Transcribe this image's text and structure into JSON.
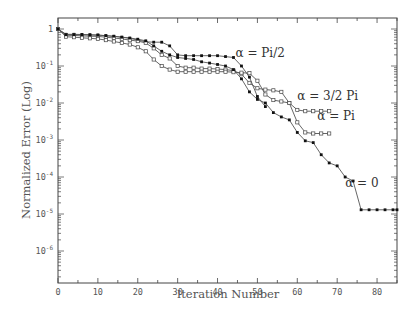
{
  "chart_data": {
    "type": "line",
    "title": "",
    "xlabel": "Iteration Number",
    "ylabel": "Normalized Error (Log)",
    "xlim": [
      0,
      85
    ],
    "ylim": [
      1e-07,
      1.6
    ],
    "yscale": "log",
    "grid": false,
    "legend": "inline labels",
    "x_ticks": [
      0,
      10,
      20,
      30,
      40,
      50,
      60,
      70,
      80
    ],
    "x_tick_labels": [
      "0",
      "10",
      "20",
      "30",
      "40",
      "50",
      "60",
      "70",
      "80"
    ],
    "y_ticks": [
      1,
      0.1,
      0.01,
      0.001,
      0.0001,
      1e-05,
      1e-06
    ],
    "y_tick_labels": [
      "1",
      "10⁻¹",
      "10⁻²",
      "10⁻³",
      "10⁻⁴",
      "10⁻⁵",
      "10⁻⁶"
    ],
    "series": [
      {
        "name": "α = Pi/2",
        "label": "α = Pi/2",
        "marker": "circle-filled",
        "x": [
          0,
          2,
          4,
          6,
          8,
          10,
          12,
          14,
          16,
          18,
          20,
          22,
          24,
          26,
          28,
          30,
          32,
          34,
          36,
          38,
          40,
          42,
          44,
          46,
          48,
          50,
          52
        ],
        "y": [
          1.0,
          0.72,
          0.72,
          0.71,
          0.7,
          0.69,
          0.66,
          0.63,
          0.6,
          0.56,
          0.5,
          0.45,
          0.44,
          0.44,
          0.35,
          0.2,
          0.19,
          0.19,
          0.19,
          0.19,
          0.19,
          0.18,
          0.17,
          0.1,
          0.05,
          0.015,
          0.008
        ]
      },
      {
        "name": "α = 3/2 Pi",
        "label": "α = 3/2 Pi",
        "marker": "square-open",
        "x": [
          0,
          2,
          4,
          6,
          8,
          10,
          12,
          14,
          16,
          18,
          20,
          22,
          24,
          26,
          28,
          30,
          32,
          34,
          36,
          38,
          40,
          42,
          44,
          46,
          48,
          50,
          52,
          54,
          56,
          58,
          60,
          62,
          64,
          66,
          68
        ],
        "y": [
          1.0,
          0.68,
          0.67,
          0.65,
          0.64,
          0.63,
          0.6,
          0.57,
          0.54,
          0.5,
          0.47,
          0.42,
          0.3,
          0.2,
          0.16,
          0.1,
          0.09,
          0.09,
          0.085,
          0.085,
          0.083,
          0.08,
          0.075,
          0.06,
          0.035,
          0.025,
          0.023,
          0.022,
          0.02,
          0.01,
          0.0065,
          0.006,
          0.006,
          0.006,
          0.006
        ]
      },
      {
        "name": "α = Pi",
        "label": "α = Pi",
        "marker": "square-open",
        "x": [
          0,
          2,
          4,
          6,
          8,
          10,
          12,
          14,
          16,
          18,
          20,
          22,
          24,
          26,
          28,
          30,
          32,
          34,
          36,
          38,
          40,
          42,
          44,
          46,
          48,
          50,
          52,
          54,
          56,
          58,
          60,
          62,
          64,
          66,
          68
        ],
        "y": [
          1.0,
          0.62,
          0.6,
          0.58,
          0.56,
          0.54,
          0.5,
          0.46,
          0.42,
          0.38,
          0.32,
          0.25,
          0.15,
          0.1,
          0.08,
          0.07,
          0.07,
          0.07,
          0.07,
          0.07,
          0.07,
          0.07,
          0.068,
          0.066,
          0.064,
          0.04,
          0.017,
          0.012,
          0.011,
          0.01,
          0.003,
          0.0016,
          0.0015,
          0.0015,
          0.0015
        ]
      },
      {
        "name": "α = 0",
        "label": "α = 0",
        "marker": "circle-filled",
        "x": [
          0,
          2,
          4,
          6,
          8,
          10,
          12,
          14,
          16,
          18,
          20,
          22,
          24,
          26,
          28,
          30,
          32,
          34,
          36,
          38,
          40,
          42,
          44,
          46,
          48,
          50,
          52,
          54,
          56,
          58,
          60,
          62,
          64,
          66,
          68,
          70,
          72,
          74,
          76,
          78,
          80,
          82,
          84,
          85
        ],
        "y": [
          1.0,
          0.7,
          0.7,
          0.7,
          0.69,
          0.68,
          0.66,
          0.64,
          0.6,
          0.57,
          0.53,
          0.48,
          0.35,
          0.25,
          0.2,
          0.17,
          0.16,
          0.15,
          0.13,
          0.12,
          0.11,
          0.1,
          0.08,
          0.045,
          0.02,
          0.0125,
          0.01,
          0.0055,
          0.0042,
          0.0035,
          0.0016,
          0.00095,
          0.00085,
          0.0004,
          0.00024,
          0.0002,
          0.0001,
          7.8e-05,
          1.3e-05,
          1.3e-05,
          1.3e-05,
          1.3e-05,
          1.3e-05,
          1.3e-05
        ]
      }
    ],
    "label_positions": {
      "α = Pi/2": [
        44.5,
        0.17
      ],
      "α = 3/2 Pi": [
        60,
        0.012
      ],
      "α = Pi": [
        65,
        0.0035
      ],
      "α = 0": [
        72,
        5.5e-05
      ]
    }
  }
}
